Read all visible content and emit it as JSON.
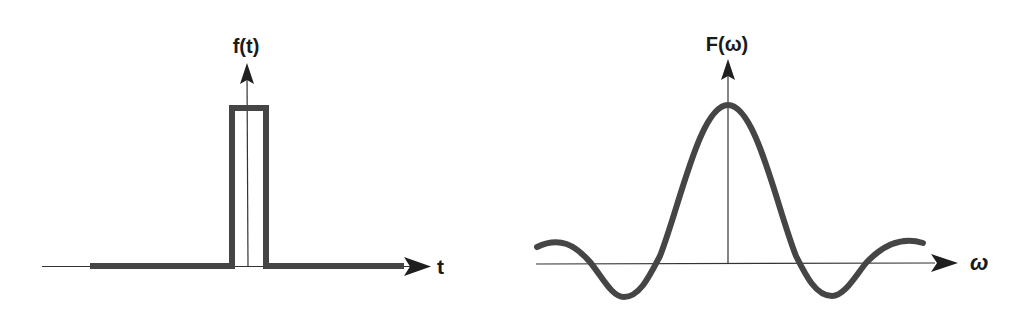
{
  "figure": {
    "left_panel": {
      "title": "Time-domain rectangular pulse",
      "y_axis_label": "f(t)",
      "x_axis_label": "t",
      "signal": "rect pulse centered at t=0"
    },
    "right_panel": {
      "title": "Frequency-domain sinc spectrum",
      "y_axis_label": "F(ω)",
      "x_axis_label": "ω",
      "signal": "sinc function centered at ω=0"
    },
    "colors": {
      "curve": "#454545",
      "axis": "#333333",
      "label": "#1a1a1a",
      "background": "#ffffff"
    }
  }
}
